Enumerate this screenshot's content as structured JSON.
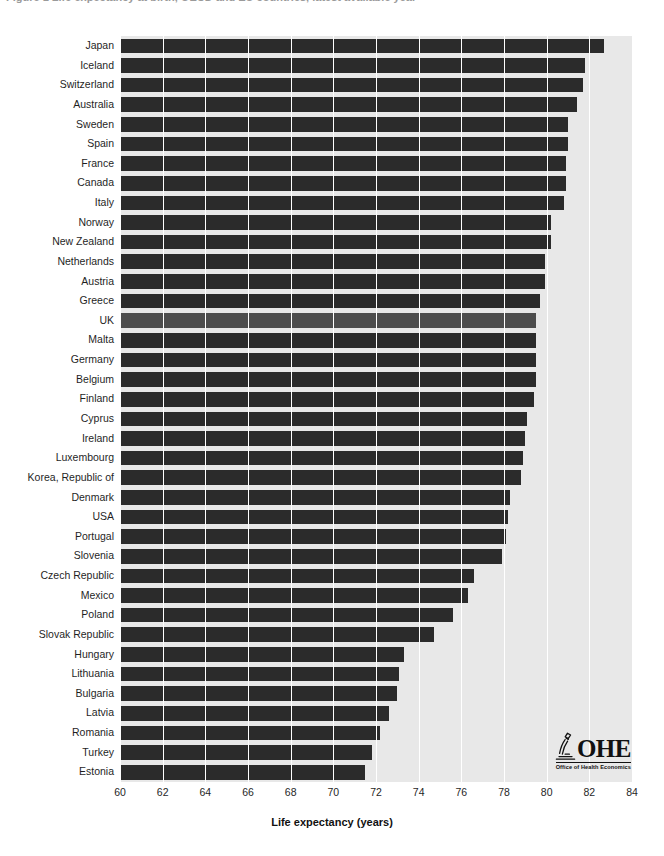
{
  "caption": {
    "text": "Figure 1  Life expectancy at birth, OECD and EU countries, latest available year"
  },
  "axis_title": "Life expectancy (years)",
  "logo": {
    "wordmark": "OHE",
    "subtitle": "Office of Health Economics",
    "mark_name": "microscope-icon"
  },
  "colors": {
    "bar": "#2b2b2b",
    "bar_highlight": "#4d4d4d",
    "plot_background": "#e8e8e8",
    "gridline": "#ffffff",
    "text": "#1f1f1f"
  },
  "chart_data": {
    "type": "bar",
    "orientation": "horizontal",
    "title": "",
    "xlabel": "Life expectancy (years)",
    "ylabel": "",
    "xlim": [
      60,
      84
    ],
    "xticks": [
      60,
      62,
      64,
      66,
      68,
      70,
      72,
      74,
      76,
      78,
      80,
      82,
      84
    ],
    "xtick_labels": [
      "60",
      "62",
      "64",
      "66",
      "68",
      "70",
      "72",
      "74",
      "76",
      "78",
      "80",
      "82",
      "84"
    ],
    "grid": true,
    "grid_axis": "x",
    "legend": "none",
    "highlight_category": "UK",
    "categories": [
      "Japan",
      "Iceland",
      "Switzerland",
      "Australia",
      "Sweden",
      "Spain",
      "France",
      "Canada",
      "Italy",
      "Norway",
      "New Zealand",
      "Netherlands",
      "Austria",
      "Greece",
      "UK",
      "Malta",
      "Germany",
      "Belgium",
      "Finland",
      "Cyprus",
      "Ireland",
      "Luxembourg",
      "Korea, Republic of",
      "Denmark",
      "USA",
      "Portugal",
      "Slovenia",
      "Czech Republic",
      "Mexico",
      "Poland",
      "Slovak Republic",
      "Hungary",
      "Lithuania",
      "Bulgaria",
      "Latvia",
      "Romania",
      "Turkey",
      "Estonia"
    ],
    "values": [
      82.7,
      81.8,
      81.7,
      81.4,
      81.0,
      81.0,
      80.9,
      80.9,
      80.8,
      80.2,
      80.2,
      79.9,
      79.9,
      79.7,
      79.5,
      79.5,
      79.5,
      79.5,
      79.4,
      79.1,
      79.0,
      78.9,
      78.8,
      78.3,
      78.2,
      78.1,
      77.9,
      76.6,
      76.3,
      75.6,
      74.7,
      73.3,
      73.1,
      73.0,
      72.6,
      72.2,
      71.8,
      71.5
    ],
    "value_unit": "years",
    "n_categories": 38
  }
}
